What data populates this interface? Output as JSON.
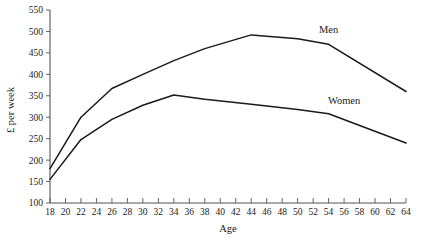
{
  "chart_data": {
    "type": "line",
    "title": "",
    "xlabel": "Age",
    "ylabel": "£ per week",
    "xlim": [
      18,
      64
    ],
    "ylim": [
      100,
      550
    ],
    "ytick_step": 50,
    "xtick_step": 2,
    "grid": false,
    "legend_position": "inline-right",
    "xticks": [
      18,
      20,
      22,
      24,
      26,
      28,
      30,
      32,
      34,
      36,
      38,
      40,
      42,
      44,
      46,
      48,
      50,
      52,
      54,
      56,
      58,
      60,
      62,
      64
    ],
    "yticks": [
      100,
      150,
      200,
      250,
      300,
      350,
      400,
      450,
      500,
      550
    ],
    "x": [
      18,
      22,
      26,
      30,
      34,
      38,
      44,
      50,
      54,
      64
    ],
    "series": [
      {
        "name": "Men",
        "label": "Men",
        "color": "#1a1a1a",
        "values": [
          180,
          300,
          367,
          400,
          432,
          460,
          492,
          483,
          470,
          360
        ]
      },
      {
        "name": "Women",
        "label": "Women",
        "color": "#1a1a1a",
        "values": [
          155,
          248,
          295,
          328,
          352,
          342,
          330,
          318,
          308,
          240
        ]
      }
    ],
    "annotations": [
      {
        "text": "Men",
        "x": 54,
        "y": 497
      },
      {
        "text": "Women",
        "x": 56,
        "y": 330
      }
    ]
  }
}
